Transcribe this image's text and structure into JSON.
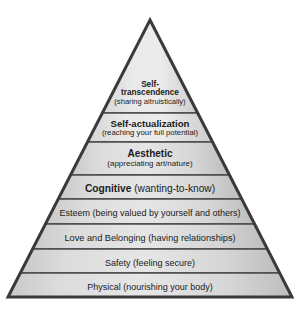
{
  "diagram": {
    "type": "pyramid",
    "colors": {
      "outline": "#3a3a3a",
      "divider": "#4a4a4a",
      "fill_light": "#eeeeee",
      "fill_dark": "#b9b9b9",
      "text": "#1b1b1b",
      "background": "#ffffff"
    },
    "apex": {
      "x": 150,
      "y": 20
    },
    "base": {
      "left_x": 8,
      "right_x": 292,
      "y": 297
    },
    "tiers": [
      {
        "index": 0,
        "level": 8,
        "title": "Self-transcendence",
        "title_lines": [
          "Self-",
          "transcendence"
        ],
        "subtitle": "(sharing altruistically)",
        "top_y": 73,
        "bottom_y": 113
      },
      {
        "index": 1,
        "level": 7,
        "title": "Self-actualization",
        "title_lines": [
          "Self-actualization"
        ],
        "subtitle": "(reaching your full potential)",
        "top_y": 113,
        "bottom_y": 142
      },
      {
        "index": 2,
        "level": 6,
        "title": "Aesthetic",
        "title_lines": [
          "Aesthetic"
        ],
        "subtitle": "(appreciating art/nature)",
        "top_y": 142,
        "bottom_y": 175
      },
      {
        "index": 3,
        "level": 5,
        "title": "Cognitive ",
        "title_lines": [
          "Cognitive "
        ],
        "subtitle": "(wanting-to-know)",
        "top_y": 175,
        "bottom_y": 199
      },
      {
        "index": 4,
        "level": 4,
        "title": "Esteem ",
        "title_lines": [
          "Esteem "
        ],
        "subtitle": "(being valued by yourself and others)",
        "top_y": 199,
        "bottom_y": 224
      },
      {
        "index": 5,
        "level": 3,
        "title": "Love and Belonging ",
        "title_lines": [
          "Love and Belonging "
        ],
        "subtitle": "(having relationships)",
        "top_y": 224,
        "bottom_y": 249
      },
      {
        "index": 6,
        "level": 2,
        "title": "Safety ",
        "title_lines": [
          "Safety "
        ],
        "subtitle": "(feeling secure)",
        "top_y": 249,
        "bottom_y": 273
      },
      {
        "index": 7,
        "level": 1,
        "title": "Physical ",
        "title_lines": [
          "Physical "
        ],
        "subtitle": "(nourishing your body)",
        "top_y": 273,
        "bottom_y": 297
      }
    ]
  }
}
